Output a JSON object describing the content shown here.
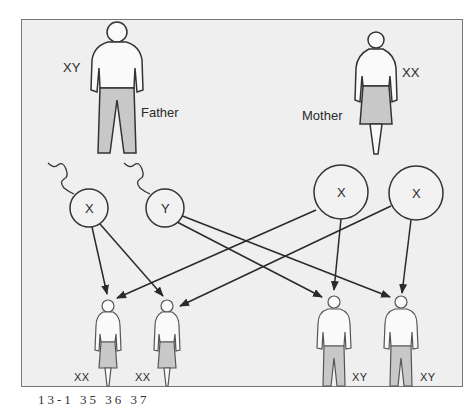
{
  "diagram": {
    "parents": {
      "father": {
        "label": "Father",
        "genotype": "XY"
      },
      "mother": {
        "label": "Mother",
        "genotype": "XX"
      }
    },
    "gametes": [
      {
        "id": "father-x",
        "label": "X",
        "from": "father"
      },
      {
        "id": "father-y",
        "label": "Y",
        "from": "father"
      },
      {
        "id": "mother-x1",
        "label": "X",
        "from": "mother"
      },
      {
        "id": "mother-x2",
        "label": "X",
        "from": "mother"
      }
    ],
    "offspring": [
      {
        "id": "daughter-1",
        "genotype": "XX",
        "sex": "female"
      },
      {
        "id": "daughter-2",
        "genotype": "XX",
        "sex": "female"
      },
      {
        "id": "son-1",
        "genotype": "XY",
        "sex": "male"
      },
      {
        "id": "son-2",
        "genotype": "XY",
        "sex": "male"
      }
    ],
    "edges": [
      [
        "father-x",
        "daughter-1"
      ],
      [
        "father-x",
        "daughter-2"
      ],
      [
        "father-y",
        "son-1"
      ],
      [
        "father-y",
        "son-2"
      ],
      [
        "mother-x1",
        "daughter-1"
      ],
      [
        "mother-x1",
        "son-1"
      ],
      [
        "mother-x2",
        "daughter-2"
      ],
      [
        "mother-x2",
        "son-2"
      ]
    ],
    "caption": "13-1  35  36  37",
    "colors": {
      "background": "#efefef",
      "stroke": "#333333",
      "fill_clothing": "#c8c8c8"
    }
  }
}
